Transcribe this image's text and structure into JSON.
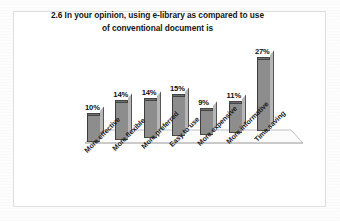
{
  "chart_data": {
    "type": "bar",
    "title": "2.6 In your opinion, using e-library as compared to use of conventional document is",
    "title_line1": "2.6 In your opinion, using e-library as compared to use",
    "title_line2": "of conventional document is",
    "categories": [
      "More effective",
      "More flexible",
      "More preferred",
      "Easy to use",
      "More expensive",
      "More informative",
      "Time saving"
    ],
    "values": [
      10,
      14,
      14,
      15,
      9,
      11,
      27
    ],
    "value_labels": [
      "10%",
      "14%",
      "14%",
      "15%",
      "9%",
      "11%",
      "27%"
    ],
    "xlabel": "",
    "ylabel": "",
    "ylim": [
      0,
      30
    ],
    "unit": "%",
    "grid": false,
    "legend": false,
    "legend_position": "none",
    "style": "3d-column",
    "colors": {
      "bar_front": "#8d8d8d",
      "bar_side": "#b6b6b6",
      "bar_top": "#6f6f6f",
      "bar_outline": "#3d3d3d",
      "frame_border": "#dededd",
      "floor_line": "#b9b9b9",
      "background": "#ffffff",
      "text": "#151515"
    }
  }
}
